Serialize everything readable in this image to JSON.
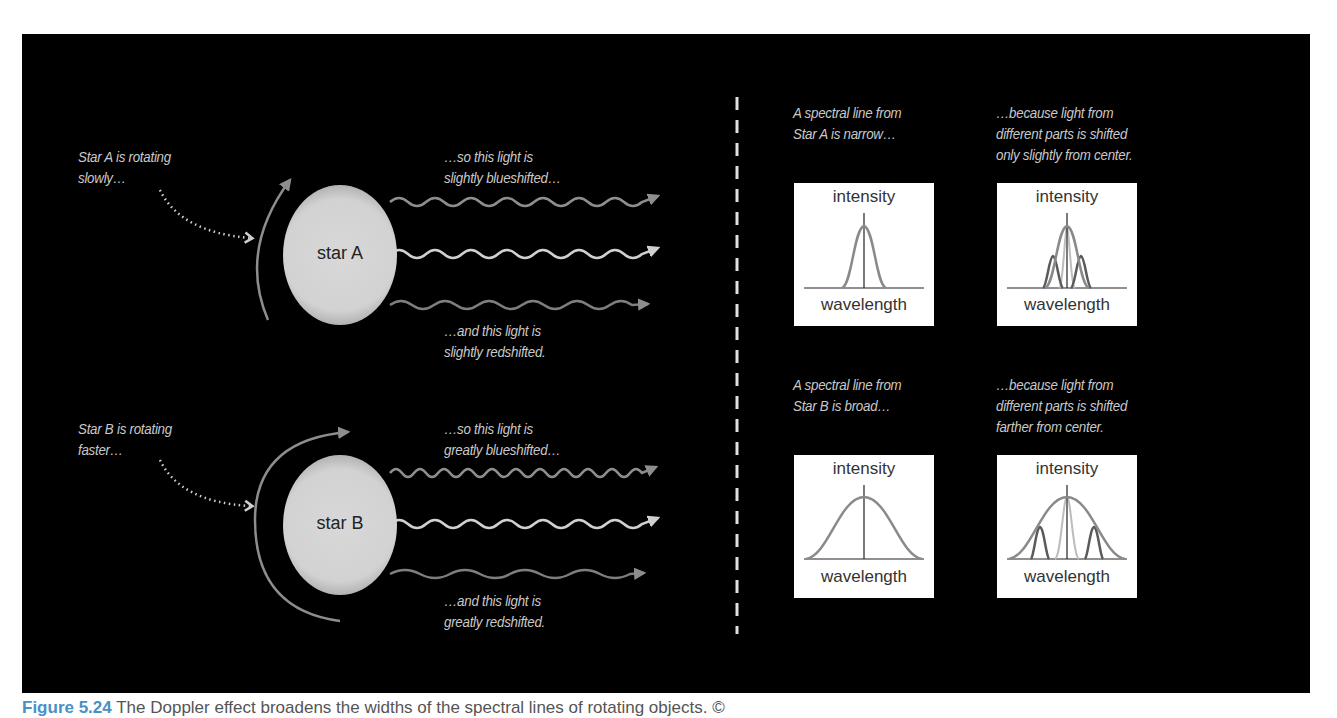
{
  "left": {
    "star_a": {
      "name": "star A",
      "rotation_label": "Star A is rotating\nslowly…",
      "blue_label": "…so this light is\nslightly blueshifted…",
      "red_label": "…and this light is\nslightly redshifted."
    },
    "star_b": {
      "name": "star B",
      "rotation_label": "Star B is rotating\nfaster…",
      "blue_label": "…so this light is\ngreatly blueshifted…",
      "red_label": "…and this light is\ngreatly redshifted."
    }
  },
  "right": {
    "row_a": {
      "narrow_label": "A spectral line from\nStar A is narrow…",
      "explain_label": "…because light from\ndifferent parts is shifted\nonly slightly from center."
    },
    "row_b": {
      "broad_label": "A spectral line from\nStar B is broad…",
      "explain_label": "…because light from\ndifferent parts is shifted\nfarther from center."
    },
    "axis": {
      "y_label": "intensity",
      "x_label": "wavelength"
    }
  },
  "caption": {
    "figure_number": "Figure 5.24",
    "text": " The Doppler effect broadens the widths of the spectral lines of rotating objects. ©"
  },
  "colors": {
    "background": "#000000",
    "text": "#c9c9c9",
    "blueshift_wave": "#8d8d8d",
    "center_wave": "#d0d0d0",
    "redshift_wave": "#7e7e7e",
    "curve": "#8a8a8a"
  }
}
